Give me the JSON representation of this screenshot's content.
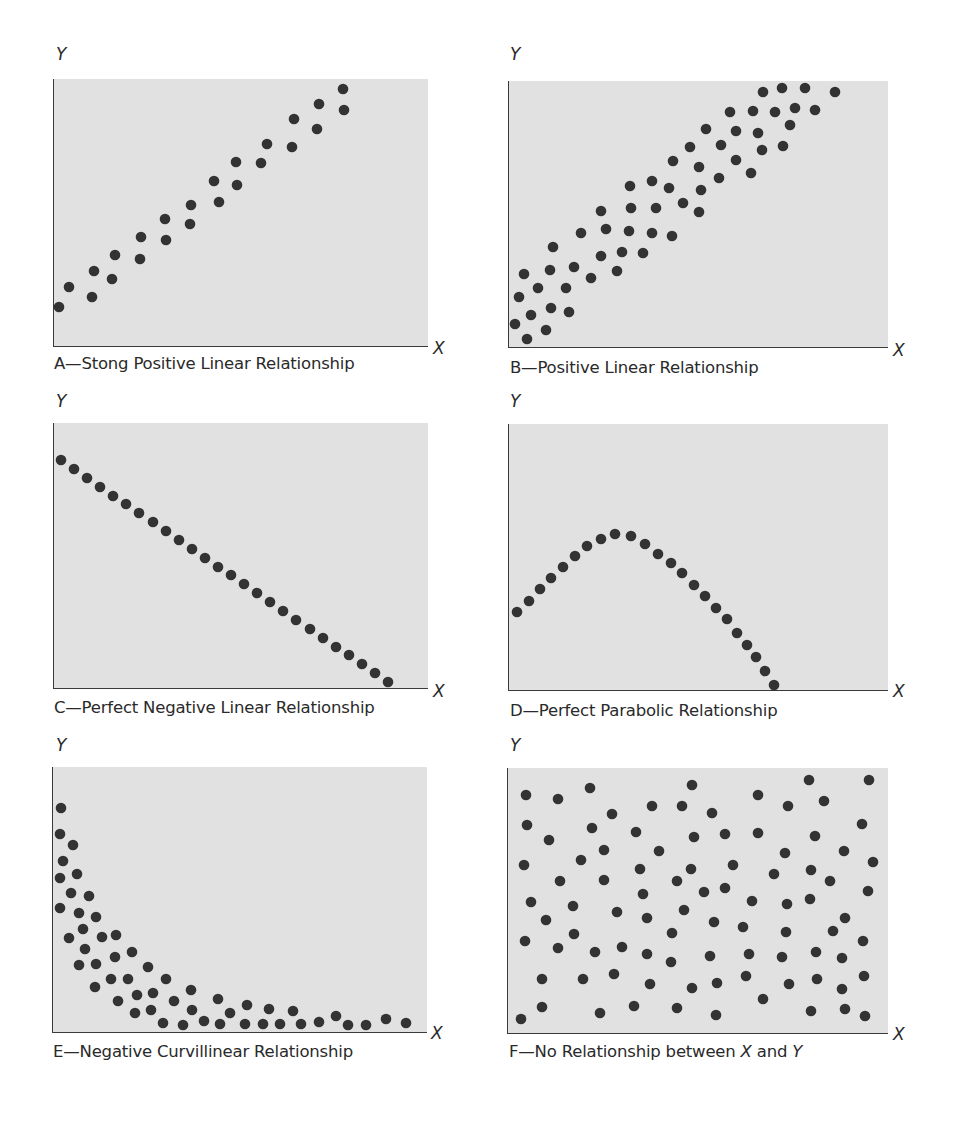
{
  "figure": {
    "dot_color": "#333333",
    "plot_bg": "#e1e1e1",
    "axis_color": "#3a3a3a",
    "dot_radius": 5.3
  },
  "chart_data": [
    {
      "id": "A",
      "type": "scatter",
      "title": "A—Stong Positive Linear Relationship",
      "xlabel": "X",
      "ylabel": "Y",
      "grid": false,
      "legend": null,
      "note": "pixel coordinates within plot area (origin top-left); no numeric axis ticks shown",
      "plot_box": {
        "left": 54,
        "top": 79,
        "width": 373,
        "height": 267
      },
      "points": [
        [
          5,
          228
        ],
        [
          15,
          208
        ],
        [
          38,
          218
        ],
        [
          40,
          192
        ],
        [
          58,
          200
        ],
        [
          61,
          176
        ],
        [
          86,
          180
        ],
        [
          87,
          158
        ],
        [
          112,
          161
        ],
        [
          111,
          140
        ],
        [
          136,
          145
        ],
        [
          137,
          126
        ],
        [
          165,
          123
        ],
        [
          160,
          102
        ],
        [
          183,
          106
        ],
        [
          182,
          83
        ],
        [
          207,
          84
        ],
        [
          213,
          65
        ],
        [
          238,
          68
        ],
        [
          240,
          40
        ],
        [
          263,
          50
        ],
        [
          265,
          25
        ],
        [
          290,
          31
        ],
        [
          289,
          10
        ]
      ]
    },
    {
      "id": "B",
      "type": "scatter",
      "title": "B—Positive Linear Relationship",
      "xlabel": "X",
      "ylabel": "Y",
      "grid": false,
      "legend": null,
      "plot_box": {
        "left": 509,
        "top": 81,
        "width": 378,
        "height": 266
      },
      "points": [
        [
          254,
          11
        ],
        [
          273,
          7
        ],
        [
          296,
          7
        ],
        [
          326,
          11
        ],
        [
          221,
          31
        ],
        [
          244,
          30
        ],
        [
          266,
          31
        ],
        [
          286,
          27
        ],
        [
          306,
          29
        ],
        [
          197,
          48
        ],
        [
          227,
          50
        ],
        [
          249,
          52
        ],
        [
          281,
          44
        ],
        [
          181,
          66
        ],
        [
          212,
          64
        ],
        [
          253,
          69
        ],
        [
          274,
          65
        ],
        [
          164,
          80
        ],
        [
          190,
          86
        ],
        [
          227,
          79
        ],
        [
          242,
          92
        ],
        [
          121,
          105
        ],
        [
          143,
          100
        ],
        [
          160,
          107
        ],
        [
          192,
          109
        ],
        [
          210,
          97
        ],
        [
          92,
          130
        ],
        [
          122,
          127
        ],
        [
          147,
          127
        ],
        [
          174,
          122
        ],
        [
          190,
          131
        ],
        [
          72,
          152
        ],
        [
          97,
          148
        ],
        [
          120,
          150
        ],
        [
          143,
          152
        ],
        [
          163,
          155
        ],
        [
          44,
          166
        ],
        [
          92,
          175
        ],
        [
          113,
          171
        ],
        [
          134,
          172
        ],
        [
          15,
          193
        ],
        [
          41,
          189
        ],
        [
          65,
          186
        ],
        [
          82,
          197
        ],
        [
          108,
          190
        ],
        [
          29,
          207
        ],
        [
          57,
          207
        ],
        [
          10,
          216
        ],
        [
          22,
          234
        ],
        [
          42,
          227
        ],
        [
          60,
          231
        ],
        [
          6,
          243
        ],
        [
          37,
          249
        ],
        [
          18,
          258
        ]
      ]
    },
    {
      "id": "C",
      "type": "scatter",
      "title": "C—Perfect Negative Linear Relationship",
      "xlabel": "X",
      "ylabel": "Y",
      "grid": false,
      "legend": null,
      "plot_box": {
        "left": 54,
        "top": 423,
        "width": 373,
        "height": 265
      },
      "points": [
        [
          7,
          37
        ],
        [
          20,
          46
        ],
        [
          33,
          55
        ],
        [
          46,
          64
        ],
        [
          59,
          73
        ],
        [
          72,
          81
        ],
        [
          85,
          90
        ],
        [
          99,
          99
        ],
        [
          112,
          108
        ],
        [
          125,
          117
        ],
        [
          138,
          126
        ],
        [
          151,
          135
        ],
        [
          164,
          144
        ],
        [
          177,
          152
        ],
        [
          190,
          161
        ],
        [
          203,
          170
        ],
        [
          216,
          179
        ],
        [
          229,
          188
        ],
        [
          242,
          197
        ],
        [
          256,
          206
        ],
        [
          269,
          215
        ],
        [
          282,
          224
        ],
        [
          295,
          232
        ],
        [
          308,
          241
        ],
        [
          321,
          250
        ],
        [
          334,
          259
        ]
      ]
    },
    {
      "id": "D",
      "type": "scatter",
      "title": "D—Perfect Parabolic Relationship",
      "xlabel": "X",
      "ylabel": "Y",
      "grid": false,
      "legend": null,
      "plot_box": {
        "left": 509,
        "top": 424,
        "width": 378,
        "height": 266
      },
      "points": [
        [
          8,
          188
        ],
        [
          20,
          177
        ],
        [
          31,
          165
        ],
        [
          42,
          154
        ],
        [
          54,
          143
        ],
        [
          66,
          132
        ],
        [
          78,
          122
        ],
        [
          92,
          115
        ],
        [
          106,
          110
        ],
        [
          122,
          112
        ],
        [
          136,
          120
        ],
        [
          149,
          130
        ],
        [
          162,
          139
        ],
        [
          173,
          149
        ],
        [
          185,
          161
        ],
        [
          196,
          172
        ],
        [
          207,
          184
        ],
        [
          218,
          195
        ],
        [
          228,
          209
        ],
        [
          238,
          221
        ],
        [
          247,
          233
        ],
        [
          256,
          247
        ],
        [
          265,
          261
        ]
      ]
    },
    {
      "id": "E",
      "type": "scatter",
      "title": "E—Negative Curvillinear Relationship",
      "xlabel": "X",
      "ylabel": "Y",
      "grid": false,
      "legend": null,
      "plot_box": {
        "left": 53,
        "top": 767,
        "width": 373,
        "height": 265
      },
      "points": [
        [
          8,
          41
        ],
        [
          7,
          67
        ],
        [
          20,
          78
        ],
        [
          10,
          94
        ],
        [
          24,
          107
        ],
        [
          7,
          111
        ],
        [
          18,
          126
        ],
        [
          36,
          129
        ],
        [
          7,
          141
        ],
        [
          26,
          146
        ],
        [
          43,
          150
        ],
        [
          30,
          162
        ],
        [
          16,
          171
        ],
        [
          49,
          170
        ],
        [
          63,
          168
        ],
        [
          32,
          182
        ],
        [
          79,
          185
        ],
        [
          62,
          190
        ],
        [
          26,
          198
        ],
        [
          43,
          197
        ],
        [
          95,
          200
        ],
        [
          58,
          212
        ],
        [
          75,
          212
        ],
        [
          113,
          212
        ],
        [
          42,
          220
        ],
        [
          84,
          228
        ],
        [
          100,
          226
        ],
        [
          138,
          223
        ],
        [
          65,
          234
        ],
        [
          121,
          234
        ],
        [
          165,
          232
        ],
        [
          82,
          246
        ],
        [
          98,
          243
        ],
        [
          139,
          243
        ],
        [
          194,
          238
        ],
        [
          177,
          246
        ],
        [
          216,
          242
        ],
        [
          240,
          244
        ],
        [
          110,
          256
        ],
        [
          130,
          258
        ],
        [
          151,
          254
        ],
        [
          167,
          257
        ],
        [
          192,
          257
        ],
        [
          210,
          257
        ],
        [
          227,
          257
        ],
        [
          248,
          257
        ],
        [
          266,
          255
        ],
        [
          283,
          249
        ],
        [
          295,
          258
        ],
        [
          313,
          258
        ],
        [
          333,
          252
        ],
        [
          353,
          256
        ]
      ]
    },
    {
      "id": "F",
      "type": "scatter",
      "title": "F—No Relationship between X and Y",
      "title_parts": [
        "F—No Relationship between ",
        "X",
        " and ",
        "Y"
      ],
      "xlabel": "X",
      "ylabel": "Y",
      "grid": false,
      "legend": null,
      "plot_box": {
        "left": 508,
        "top": 768,
        "width": 379,
        "height": 265
      },
      "points": [
        [
          18,
          27
        ],
        [
          50,
          31
        ],
        [
          82,
          20
        ],
        [
          184,
          17
        ],
        [
          301,
          12
        ],
        [
          361,
          12
        ],
        [
          104,
          46
        ],
        [
          144,
          38
        ],
        [
          174,
          38
        ],
        [
          204,
          45
        ],
        [
          250,
          27
        ],
        [
          280,
          38
        ],
        [
          316,
          33
        ],
        [
          19,
          57
        ],
        [
          41,
          72
        ],
        [
          84,
          60
        ],
        [
          128,
          64
        ],
        [
          186,
          69
        ],
        [
          217,
          66
        ],
        [
          250,
          65
        ],
        [
          307,
          68
        ],
        [
          354,
          56
        ],
        [
          96,
          82
        ],
        [
          151,
          83
        ],
        [
          277,
          85
        ],
        [
          336,
          83
        ],
        [
          16,
          97
        ],
        [
          73,
          92
        ],
        [
          132,
          101
        ],
        [
          183,
          101
        ],
        [
          225,
          97
        ],
        [
          266,
          106
        ],
        [
          303,
          102
        ],
        [
          365,
          94
        ],
        [
          52,
          113
        ],
        [
          96,
          112
        ],
        [
          169,
          113
        ],
        [
          196,
          124
        ],
        [
          217,
          120
        ],
        [
          322,
          113
        ],
        [
          135,
          126
        ],
        [
          244,
          133
        ],
        [
          279,
          136
        ],
        [
          302,
          131
        ],
        [
          360,
          123
        ],
        [
          23,
          134
        ],
        [
          65,
          138
        ],
        [
          109,
          144
        ],
        [
          176,
          142
        ],
        [
          38,
          152
        ],
        [
          139,
          150
        ],
        [
          206,
          154
        ],
        [
          235,
          159
        ],
        [
          337,
          150
        ],
        [
          66,
          166
        ],
        [
          164,
          165
        ],
        [
          278,
          164
        ],
        [
          325,
          163
        ],
        [
          17,
          173
        ],
        [
          50,
          180
        ],
        [
          87,
          184
        ],
        [
          114,
          179
        ],
        [
          139,
          186
        ],
        [
          163,
          194
        ],
        [
          202,
          188
        ],
        [
          241,
          186
        ],
        [
          274,
          189
        ],
        [
          308,
          184
        ],
        [
          334,
          190
        ],
        [
          355,
          173
        ],
        [
          34,
          211
        ],
        [
          75,
          211
        ],
        [
          106,
          206
        ],
        [
          142,
          216
        ],
        [
          184,
          220
        ],
        [
          209,
          215
        ],
        [
          238,
          208
        ],
        [
          281,
          216
        ],
        [
          309,
          211
        ],
        [
          334,
          221
        ],
        [
          356,
          208
        ],
        [
          255,
          231
        ],
        [
          13,
          251
        ],
        [
          34,
          239
        ],
        [
          92,
          245
        ],
        [
          126,
          238
        ],
        [
          169,
          240
        ],
        [
          208,
          247
        ],
        [
          303,
          243
        ],
        [
          337,
          241
        ],
        [
          357,
          248
        ]
      ]
    }
  ],
  "panels": {
    "A": {
      "ylabel": "Y",
      "xlabel": "X",
      "caption": "A—Stong Positive Linear Relationship"
    },
    "B": {
      "ylabel": "Y",
      "xlabel": "X",
      "caption": "B—Positive Linear Relationship"
    },
    "C": {
      "ylabel": "Y",
      "xlabel": "X",
      "caption": "C—Perfect Negative Linear Relationship"
    },
    "D": {
      "ylabel": "Y",
      "xlabel": "X",
      "caption": "D—Perfect Parabolic Relationship"
    },
    "E": {
      "ylabel": "Y",
      "xlabel": "X",
      "caption": "E—Negative Curvillinear Relationship"
    },
    "F": {
      "ylabel": "Y",
      "xlabel": "X",
      "caption_prefix": "F—No Relationship between ",
      "caption_x": "X",
      "caption_and": " and ",
      "caption_y": "Y"
    }
  }
}
